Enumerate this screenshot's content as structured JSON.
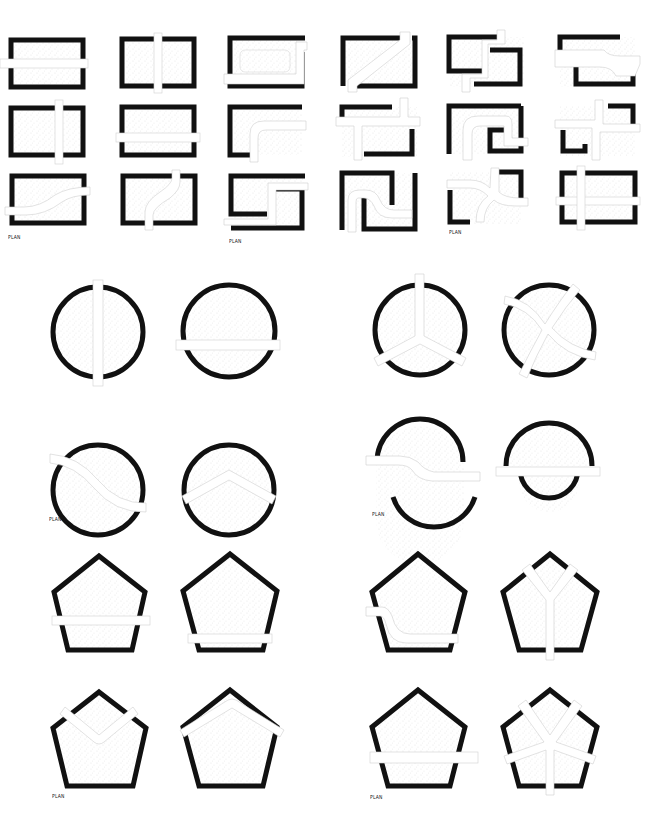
{
  "figure": {
    "sections": [
      {
        "name": "rectangles",
        "rows": 3,
        "columns": 6,
        "shape": "rectangle"
      },
      {
        "name": "circles",
        "rows": 2,
        "columns": 4,
        "shape": "circle"
      },
      {
        "name": "pentagons",
        "rows": 2,
        "columns": 4,
        "shape": "pentagon"
      }
    ],
    "labels": {
      "plan_1": "PLAN",
      "plan_2": "PLAN",
      "plan_3": "PLAN",
      "plan_4": "PLAN",
      "plan_5": "PLAN",
      "plan_6": "PLAN",
      "plan_7": "PLAN"
    },
    "colors": {
      "wall": "#111111",
      "stipple": "#9a9a9a",
      "path": "#ffffff",
      "background": "#ffffff"
    }
  }
}
